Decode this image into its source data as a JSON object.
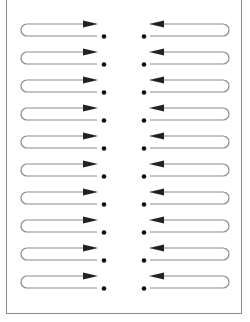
{
  "diagram": {
    "title": "",
    "rows": 10,
    "left_column": {
      "direction": "right",
      "marker": "dot",
      "description": "loop arrows pointing right toward center with dot"
    },
    "right_column": {
      "direction": "left",
      "marker": "dot",
      "description": "loop arrows pointing left toward center with dot"
    },
    "colors": {
      "line": "#8a8a8a",
      "arrowhead": "#222222",
      "dot": "#111111",
      "frame": "#8a8a8a"
    }
  }
}
